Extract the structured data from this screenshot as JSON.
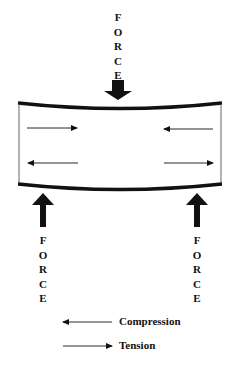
{
  "diagram": {
    "title": "",
    "top_force": {
      "label": "FORCE",
      "letters": [
        "F",
        "O",
        "R",
        "C",
        "E"
      ],
      "direction": "down"
    },
    "left_force": {
      "label": "FORCE",
      "letters": [
        "F",
        "O",
        "R",
        "C",
        "E"
      ],
      "direction": "up"
    },
    "right_force": {
      "label": "FORCE",
      "letters": [
        "F",
        "O",
        "R",
        "C",
        "E"
      ],
      "direction": "up"
    },
    "beam": {
      "top_left_arrow": "tension",
      "top_right_arrow": "compression",
      "bottom_left_arrow": "compression",
      "bottom_right_arrow": "tension"
    },
    "legend": {
      "compression_label": "Compression",
      "tension_label": "Tension"
    },
    "colors": {
      "ink": "#111111",
      "background": "#ffffff"
    }
  }
}
